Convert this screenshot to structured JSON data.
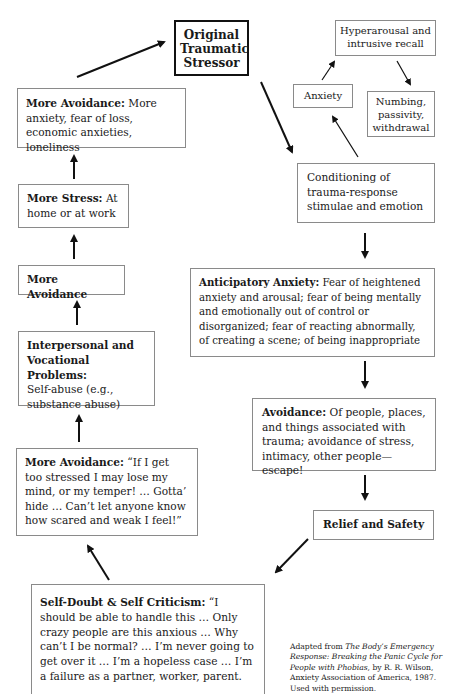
{
  "diagram": {
    "nodes": {
      "original_stressor": {
        "label": "Original Traumatic Stressor",
        "line1": "Original",
        "line2": "Traumatic",
        "line3": "Stressor"
      },
      "hyperarousal": {
        "line1": "Hyperarousal and",
        "line2": "intrusive recall"
      },
      "anxiety": {
        "label": "Anxiety"
      },
      "numbing": {
        "line1": "Numbing,",
        "line2": "passivity,",
        "line3": "withdrawal"
      },
      "conditioning": {
        "line1": "Conditioning of",
        "line2": "trauma-response",
        "line3": "stimulae and emotion"
      },
      "anticipatory_anxiety": {
        "title": "Anticipatory Anxiety:",
        "text": " Fear of heightened anxiety and arousal; fear of being mentally and emotionally out of control or disorganized; fear of reacting abnormally, of creating a scene; of being inappropriate"
      },
      "avoidance": {
        "title": "Avoidance:",
        "text": " Of people, places, and things associated with trauma; avoidance of stress, intimacy, other people—escape!"
      },
      "relief_safety": {
        "label": "Relief and Safety"
      },
      "self_doubt": {
        "title": "Self-Doubt & Self Criticism:",
        "text": " “I should be able to handle this … Only crazy people are this anxious … Why can’t I be normal? … I’m never going to get over it … I’m a hopeless case … I’m a failure as a partner, worker, parent."
      },
      "more_avoidance_quote": {
        "title": "More Avoidance:",
        "text": " “If I get too stressed I may lose my mind, or my temper! … Gotta’ hide … Can’t let anyone know how scared and weak I feel!”"
      },
      "interpersonal": {
        "title": "Interpersonal and Vocational Problems:",
        "text": "Self-abuse (e.g., substance abuse)"
      },
      "more_avoidance_mid": {
        "label": "More Avoidance"
      },
      "more_stress": {
        "title": "More Stress:",
        "text": " At home or at work"
      },
      "more_avoidance_top": {
        "title": "More Avoidance:",
        "text": " More anxiety, fear of loss, economic anxieties, loneliness"
      }
    },
    "edges": [
      [
        "original_stressor",
        "conditioning"
      ],
      [
        "conditioning",
        "anxiety"
      ],
      [
        "anxiety",
        "hyperarousal"
      ],
      [
        "hyperarousal",
        "numbing"
      ],
      [
        "conditioning",
        "anticipatory_anxiety"
      ],
      [
        "anticipatory_anxiety",
        "avoidance"
      ],
      [
        "avoidance",
        "relief_safety"
      ],
      [
        "relief_safety",
        "self_doubt"
      ],
      [
        "self_doubt",
        "more_avoidance_quote"
      ],
      [
        "more_avoidance_quote",
        "interpersonal"
      ],
      [
        "interpersonal",
        "more_avoidance_mid"
      ],
      [
        "more_avoidance_mid",
        "more_stress"
      ],
      [
        "more_stress",
        "more_avoidance_top"
      ],
      [
        "more_avoidance_top",
        "original_stressor"
      ]
    ]
  },
  "citation": {
    "prefix": "Adapted from ",
    "title": "The Body’s Emergency Response: Breaking the Panic Cycle for People with Phobias",
    "suffix": ", by R. R. Wilson, Anxiety Association of America, 1987. Used with permission."
  }
}
